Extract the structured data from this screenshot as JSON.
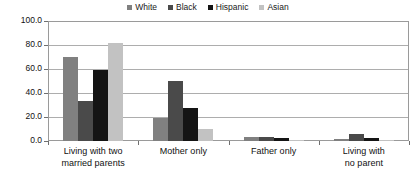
{
  "chart_data": {
    "type": "bar",
    "title": "",
    "subtitle": "",
    "xlabel": "",
    "ylabel": "",
    "ylim": [
      0,
      100
    ],
    "ytick_labels": [
      "100.0",
      "80.0",
      "60.0",
      "40.0",
      "20.0",
      "0.0"
    ],
    "ytick_values": [
      100,
      80,
      60,
      40,
      20,
      0
    ],
    "grid": true,
    "legend_position": "top-center",
    "categories": [
      "Living with two married parents",
      "Mother only",
      "Father only",
      "Living with no parent"
    ],
    "category_lines": [
      [
        "Living with two",
        "married parents"
      ],
      [
        "Mother only",
        ""
      ],
      [
        "Father only",
        ""
      ],
      [
        "Living with",
        "no parent"
      ]
    ],
    "series": [
      {
        "name": "White",
        "color": "#808080",
        "values": [
          70.0,
          19.0,
          3.0,
          2.0
        ]
      },
      {
        "name": "Black",
        "color": "#4a4a4a",
        "values": [
          33.0,
          50.0,
          3.5,
          6.0
        ]
      },
      {
        "name": "Hispanic",
        "color": "#141414",
        "values": [
          59.0,
          27.5,
          2.5,
          2.5
        ]
      },
      {
        "name": "Asian",
        "color": "#c2c2c2",
        "values": [
          82.0,
          10.0,
          1.0,
          1.0
        ]
      }
    ]
  },
  "legend": {
    "entries": [
      {
        "label": "White"
      },
      {
        "label": "Black"
      },
      {
        "label": "Hispanic"
      },
      {
        "label": "Asian"
      }
    ]
  }
}
